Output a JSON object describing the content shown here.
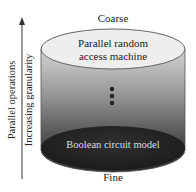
{
  "diagram": {
    "top_label": "Coarse",
    "bottom_label": "Fine",
    "top_model": {
      "line1": "Parallel random",
      "line2": "access machine"
    },
    "bottom_model": "Boolean circuit model",
    "axis": {
      "label_outer": "Parallel operations",
      "label_inner": "Increasing granularity",
      "direction": "up"
    },
    "ellipsis_dots": 3,
    "colors": {
      "top_face": "#ececec",
      "body_top": "#cfcfcf",
      "body_bottom": "#2a2a2a",
      "bottom_face": "#262626",
      "outline": "#555555",
      "text": "#222222",
      "bottom_text": "#dddddd"
    }
  }
}
